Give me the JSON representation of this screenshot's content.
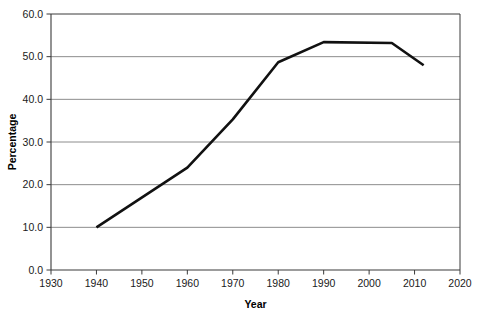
{
  "chart_data": {
    "type": "line",
    "title": "",
    "subtitle": "",
    "xlabel": "Year",
    "ylabel": "Percentage",
    "xlim": [
      1930,
      2020
    ],
    "ylim": [
      0.0,
      60.0
    ],
    "xticks": [
      1930,
      1940,
      1950,
      1960,
      1970,
      1980,
      1990,
      2000,
      2010,
      2020
    ],
    "xtick_labels": [
      "1930",
      "1940",
      "1950",
      "1960",
      "1970",
      "1980",
      "1990",
      "2000",
      "2010",
      "2020"
    ],
    "yticks": [
      0.0,
      10.0,
      20.0,
      30.0,
      40.0,
      50.0,
      60.0
    ],
    "ytick_labels": [
      "0.0",
      "10.0",
      "20.0",
      "30.0",
      "40.0",
      "50.0",
      "60.0"
    ],
    "grid": "horizontal",
    "grid_color": "#8c8c8c",
    "legend": "none",
    "annotations": [],
    "series": [
      {
        "name": "Percentage",
        "color": "#111111",
        "line_width": 2.6,
        "x": [
          1940,
          1960,
          1970,
          1980,
          1990,
          2005,
          2012
        ],
        "values": [
          10.0,
          24.0,
          35.3,
          48.7,
          53.4,
          53.2,
          48.0
        ]
      }
    ]
  },
  "axes": {
    "x_title": "Year",
    "y_title": "Percentage",
    "frame_color": "#3a3a3a"
  }
}
